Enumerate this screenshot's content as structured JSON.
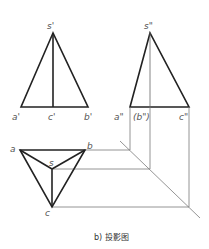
{
  "caption": "b) 投影图",
  "colors": {
    "outline": "#222222",
    "projector": "#7a7a7a",
    "label": "#555555"
  },
  "front_view": {
    "labels": {
      "s": "s'",
      "a": "a'",
      "c": "c'",
      "b": "b'"
    },
    "points": {
      "s": [
        53,
        33
      ],
      "a": [
        21,
        107
      ],
      "c": [
        53,
        107
      ],
      "b": [
        88,
        107
      ]
    }
  },
  "side_view": {
    "labels": {
      "s": "s\"",
      "a": "a\"",
      "b": "(b\")",
      "c": "c\""
    },
    "points": {
      "s": [
        150,
        33
      ],
      "a": [
        130,
        107
      ],
      "b": [
        150,
        107
      ],
      "c": [
        189,
        107
      ]
    }
  },
  "top_view": {
    "labels": {
      "a": "a",
      "b": "b",
      "s": "s",
      "c": "c"
    },
    "points": {
      "a": [
        20,
        150
      ],
      "b": [
        85,
        150
      ],
      "s": [
        52,
        169
      ],
      "c": [
        52,
        207
      ]
    }
  },
  "miter_line": {
    "from": [
      120,
      141
    ],
    "to": [
      200,
      218
    ]
  }
}
